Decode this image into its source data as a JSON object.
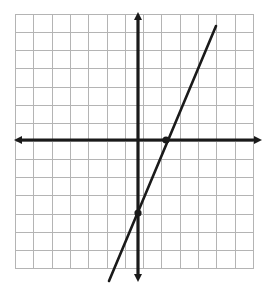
{
  "figure": {
    "kind": "coordinate-plane-line-graph",
    "width": 269,
    "height": 293,
    "background_color": "#ffffff",
    "title": "",
    "caption": ""
  },
  "chart_data": {
    "type": "line",
    "title": "",
    "xlabel": "",
    "ylabel": "",
    "xlim": [
      -7,
      6
    ],
    "ylim": [
      -7,
      7
    ],
    "grid": true,
    "grid_step": 1,
    "axis_labels_shown": false,
    "tick_labels_shown": false,
    "legend": "none",
    "series": [
      {
        "name": "line",
        "equation": "y = 2.5x - 4",
        "slope": 2.5,
        "y_intercept": -4,
        "x_intercept": 1.6,
        "x": [
          -1.6,
          4.4
        ],
        "y": [
          -8,
          7
        ],
        "color": "#1a1a1a",
        "points_marked": [
          {
            "label": "y-intercept",
            "x": 0,
            "y": -4
          },
          {
            "label": "x-intercept",
            "x": 1.6,
            "y": 0
          }
        ]
      }
    ],
    "axes": {
      "x_axis": {
        "arrows": "both",
        "color": "#1a1a1a"
      },
      "y_axis": {
        "arrows": "both",
        "color": "#1a1a1a"
      }
    }
  },
  "geometry": {
    "grid": {
      "left": 15,
      "top": 14,
      "right": 253,
      "bottom": 268,
      "columns": 13,
      "rows": 14,
      "cell_size": 18.3,
      "line_color": "#b4b4b4",
      "border_color": "#b4b4b4"
    },
    "origin": {
      "x": 138,
      "y": 140
    },
    "axis_stroke": 3.2,
    "line_stroke": 2.6,
    "dot_radius": 3.6,
    "axis_color": "#1a1a1a",
    "line_color": "#1a1a1a",
    "x_axis_start": {
      "x": 20,
      "y": 140
    },
    "x_axis_end": {
      "x": 258,
      "y": 140
    },
    "y_axis_start": {
      "x": 138,
      "y": 18
    },
    "y_axis_end": {
      "x": 138,
      "y": 278
    },
    "line_start": {
      "x": 109,
      "y": 281
    },
    "line_end": {
      "x": 216,
      "y": 26
    },
    "dot_y_intercept": {
      "x": 138,
      "y": 213
    },
    "dot_x_intercept": {
      "x": 166,
      "y": 140
    }
  }
}
